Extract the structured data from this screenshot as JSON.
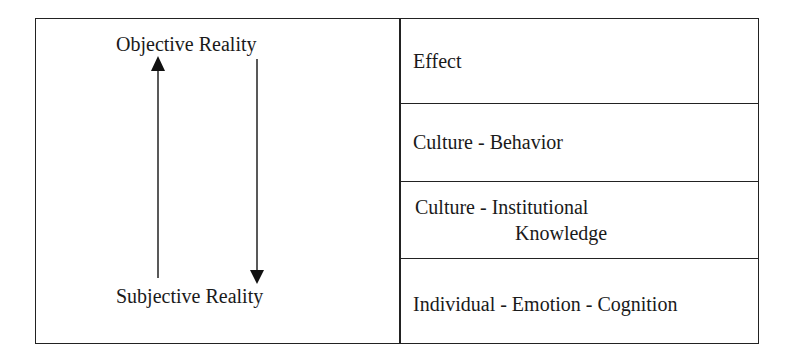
{
  "diagram": {
    "left_panel": {
      "top_label": "Objective Reality",
      "bottom_label": "Subjective Reality",
      "arrows": [
        {
          "name": "up-arrow",
          "direction": "up",
          "from": "Subjective Reality",
          "to": "Objective Reality"
        },
        {
          "name": "down-arrow",
          "direction": "down",
          "from": "Objective Reality",
          "to": "Subjective Reality"
        }
      ]
    },
    "right_panel": {
      "layers": [
        {
          "label": "Effect"
        },
        {
          "label": "Culture - Behavior"
        },
        {
          "label_line1": "Culture - Institutional",
          "label_line2": "Knowledge"
        },
        {
          "label": "Individual - Emotion - Cognition"
        }
      ]
    },
    "colors": {
      "line": "#222222",
      "text": "#1a1a1a",
      "background": "#ffffff"
    }
  }
}
